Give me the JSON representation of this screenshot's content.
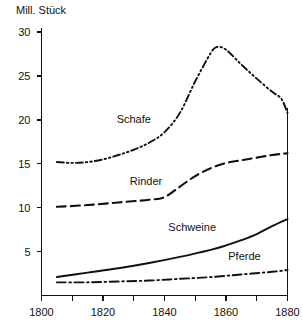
{
  "chart_data": {
    "type": "line",
    "title": "Mill. Stück",
    "xlabel": "",
    "ylabel": "Mill. Stück",
    "xlim": [
      1800,
      1880
    ],
    "ylim": [
      0,
      30
    ],
    "xticks": [
      1800,
      1810,
      1820,
      1830,
      1840,
      1850,
      1860,
      1870,
      1880
    ],
    "xtick_labels": [
      "1800",
      "",
      "1820",
      "",
      "1840",
      "",
      "1860",
      "",
      "1880"
    ],
    "yticks": [
      5,
      10,
      15,
      20,
      25,
      30
    ],
    "ytick_labels": [
      "5",
      "10",
      "15",
      "20",
      "25",
      "30"
    ],
    "grid": false,
    "legend": "inline-labels",
    "series": [
      {
        "name": "Schafe",
        "style": "dash-dot-dot",
        "label_x": 1830,
        "label_y": 19.6,
        "x": [
          1805,
          1810,
          1815,
          1820,
          1825,
          1830,
          1835,
          1840,
          1845,
          1850,
          1855,
          1857,
          1860,
          1865,
          1870,
          1875,
          1878,
          1880
        ],
        "values": [
          15.2,
          15.1,
          15.2,
          15.5,
          16.0,
          16.6,
          17.4,
          18.6,
          20.8,
          24.4,
          27.6,
          28.3,
          28.0,
          26.3,
          24.7,
          23.2,
          22.4,
          20.8
        ]
      },
      {
        "name": "Rinder",
        "style": "dashed",
        "label_x": 1834,
        "label_y": 12.6,
        "x": [
          1805,
          1815,
          1825,
          1835,
          1840,
          1845,
          1850,
          1855,
          1860,
          1865,
          1870,
          1875,
          1880
        ],
        "values": [
          10.1,
          10.3,
          10.6,
          10.9,
          11.2,
          12.4,
          13.6,
          14.5,
          15.1,
          15.4,
          15.7,
          16.0,
          16.2
        ]
      },
      {
        "name": "Schweine",
        "style": "solid",
        "label_x": 1849,
        "label_y": 7.4,
        "x": [
          1805,
          1815,
          1825,
          1835,
          1845,
          1855,
          1860,
          1865,
          1870,
          1875,
          1880
        ],
        "values": [
          2.1,
          2.6,
          3.1,
          3.7,
          4.4,
          5.2,
          5.7,
          6.3,
          7.0,
          7.9,
          8.7
        ]
      },
      {
        "name": "Pferde",
        "style": "dash-dot",
        "label_x": 1866,
        "label_y": 4.1,
        "x": [
          1805,
          1815,
          1825,
          1835,
          1845,
          1855,
          1865,
          1875,
          1880
        ],
        "values": [
          1.5,
          1.5,
          1.6,
          1.7,
          1.9,
          2.1,
          2.4,
          2.7,
          2.9
        ]
      }
    ]
  },
  "axis": {
    "y_title": "Mill. Stück"
  }
}
